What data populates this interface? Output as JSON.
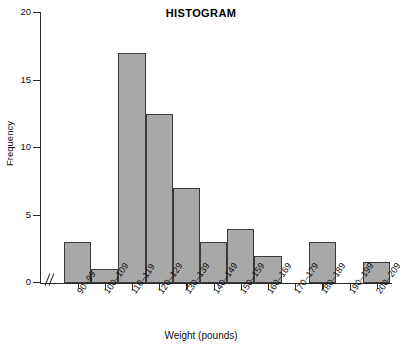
{
  "chart_data": {
    "type": "bar",
    "title": "HISTOGRAM",
    "xlabel": "Weight (pounds)",
    "ylabel": "Frequency",
    "categories": [
      "90–99",
      "100–109",
      "110–119",
      "120–129",
      "130–139",
      "140–149",
      "150–159",
      "160–169",
      "170–179",
      "180–189",
      "190–199",
      "200–209"
    ],
    "values": [
      3,
      1,
      17,
      12.5,
      7,
      3,
      4,
      2,
      0,
      3,
      0,
      1.5
    ],
    "ylim": [
      0,
      20
    ],
    "ytick_labels": [
      "0",
      "5",
      "10",
      "15",
      "20"
    ],
    "ytick_values": [
      0,
      5,
      10,
      15,
      20
    ],
    "grid": false,
    "legend": false,
    "axis_break": "//",
    "bar_fill_color": "#a8a8a8",
    "bar_edge_color": "#3a3a3a",
    "axis_color": "#2b2b2b",
    "background_color": "#ffffff"
  }
}
